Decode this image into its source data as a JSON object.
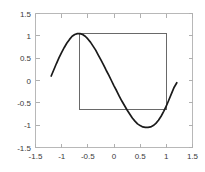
{
  "figure": {
    "background_color": "#ffffff",
    "axis_color": "#b8b8b8",
    "curve_color": "#1a1a1a",
    "rect_color": "#595959",
    "tick_label_color": "#3a3a3a"
  },
  "axes": {
    "x_ticks": [
      "-1.5",
      "-1",
      "-0.5",
      "0",
      "0.5",
      "1",
      "1.5"
    ],
    "y_ticks": [
      "1.5",
      "1",
      "0.5",
      "0",
      "-0.5",
      "-1",
      "-1.5"
    ]
  },
  "chart_data": {
    "type": "line",
    "title": "",
    "subtitle": "",
    "xlabel": "",
    "ylabel": "",
    "xlim": [
      -1.5,
      1.5
    ],
    "ylim": [
      -1.5,
      1.5
    ],
    "xticks": [
      -1.5,
      -1,
      -0.5,
      0,
      0.5,
      1,
      1.5
    ],
    "yticks": [
      -1.5,
      -1,
      -0.5,
      0,
      0.5,
      1,
      1.5
    ],
    "xtick_labels": [
      "-1.5",
      "-1",
      "-0.5",
      "0",
      "0.5",
      "1",
      "1.5"
    ],
    "ytick_labels": [
      "1.5",
      "1",
      "0.5",
      "0",
      "-0.5",
      "-1",
      "-1.5"
    ],
    "grid": false,
    "legend": null,
    "legend_position": "none",
    "series": [
      {
        "name": "curve",
        "kind": "line",
        "color": "#1a1a1a",
        "linewidth": 1.7,
        "x": [
          -1.2,
          -1.15,
          -1.1,
          -1.05,
          -1.0,
          -0.95,
          -0.9,
          -0.85,
          -0.8,
          -0.75,
          -0.7,
          -0.65,
          -0.6,
          -0.55,
          -0.5,
          -0.45,
          -0.4,
          -0.35,
          -0.3,
          -0.25,
          -0.2,
          -0.15,
          -0.1,
          -0.05,
          0.0,
          0.05,
          0.1,
          0.15,
          0.2,
          0.25,
          0.3,
          0.35,
          0.4,
          0.45,
          0.5,
          0.55,
          0.6,
          0.65,
          0.7,
          0.75,
          0.8,
          0.85,
          0.9,
          0.95,
          1.0,
          1.05,
          1.1,
          1.15,
          1.2
        ],
        "y": [
          0.1,
          0.24,
          0.38,
          0.51,
          0.63,
          0.74,
          0.84,
          0.92,
          0.99,
          1.03,
          1.05,
          1.05,
          1.03,
          0.99,
          0.93,
          0.86,
          0.77,
          0.68,
          0.57,
          0.46,
          0.35,
          0.23,
          0.12,
          0.0,
          -0.12,
          -0.23,
          -0.35,
          -0.46,
          -0.56,
          -0.66,
          -0.75,
          -0.84,
          -0.91,
          -0.97,
          -1.01,
          -1.04,
          -1.05,
          -1.05,
          -1.04,
          -1.01,
          -0.96,
          -0.89,
          -0.8,
          -0.69,
          -0.57,
          -0.43,
          -0.29,
          -0.15,
          -0.05
        ]
      }
    ],
    "annotations": [
      {
        "type": "rectangle",
        "name": "overlay-rectangle",
        "x_left": -0.65,
        "x_right": 1.0,
        "y_top": 1.05,
        "y_bottom": -0.65,
        "fill": "none",
        "stroke": "#595959"
      }
    ]
  }
}
